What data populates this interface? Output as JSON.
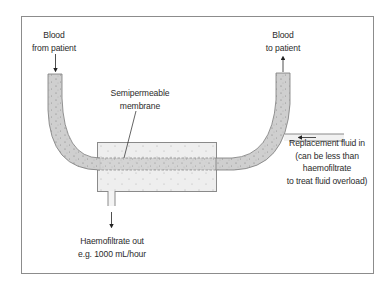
{
  "diagram": {
    "labels": {
      "blood_from_patient": [
        "Blood",
        "from patient"
      ],
      "blood_to_patient": [
        "Blood",
        "to patient"
      ],
      "membrane": [
        "Semipermeable",
        "membrane"
      ],
      "replacement_fluid": [
        "Replacement fluid in",
        "(can be less than",
        "haemofiltrate",
        "to treat fluid overload)"
      ],
      "haemofiltrate_out": [
        "Haemofiltrate out",
        "e.g. 1000 mL/hour"
      ]
    },
    "colors": {
      "frame": "#8c8c8c",
      "tube_fill": "#cfcfcf",
      "tube_stroke": "#7a7a7a",
      "filter_fill": "#eeeeee",
      "filter_stroke": "#8a8a8a",
      "replacement_fill": "#f1f1f1",
      "text": "#2b2b2b",
      "arrow": "#222222"
    }
  }
}
